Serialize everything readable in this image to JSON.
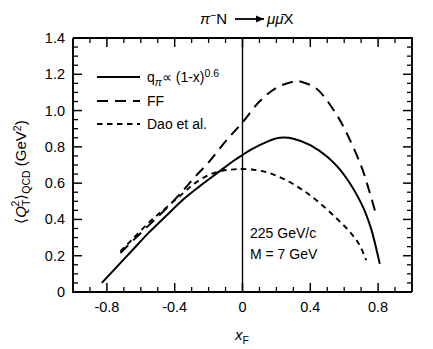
{
  "figure": {
    "top_title": {
      "beam": "π",
      "beam_charge": "−",
      "target": "N",
      "arrow": "⟶",
      "products_mu": "μ",
      "products_mubar": "μ̄",
      "products_x": "X",
      "full": "π−N ⟶ μμ̄X"
    },
    "y_axis_title": {
      "bracket_open": "⟨",
      "q": "Q",
      "sub_t": "T",
      "sup_2": "2",
      "bracket_close": "⟩",
      "sub_qcd": "QCD",
      "units": "(GeV",
      "units_sup": "2",
      "units_close": ")",
      "full": "⟨Q²ₜ⟩QCD (GeV²)"
    },
    "x_axis_title": {
      "main": "x",
      "sub": "F",
      "full": "xF"
    },
    "annotation": {
      "line1": "225 GeV/c",
      "line2": "M = 7 GeV"
    },
    "legend": [
      {
        "style": "solid",
        "label_parts": {
          "q": "q",
          "sub": "π",
          "prop": "∝",
          "expr": "(1-x)",
          "exp": "0.6"
        },
        "label": "qπ ∝ (1-x)0.6"
      },
      {
        "style": "long-dash",
        "label": "FF"
      },
      {
        "style": "short-dash",
        "label": "Dao et al."
      }
    ]
  },
  "chart_data": {
    "type": "line",
    "xlabel": "x_F",
    "ylabel": "⟨Q_T^2⟩_QCD  (GeV^2)",
    "xlim": [
      -1.0,
      1.0
    ],
    "ylim": [
      0,
      1.4
    ],
    "xticks": [
      -0.8,
      -0.4,
      0,
      0.4,
      0.8
    ],
    "xtick_labels": [
      "-0.8",
      "-0.4",
      "0",
      "0.4",
      "0.8"
    ],
    "yticks": [
      0,
      0.2,
      0.4,
      0.6,
      0.8,
      1.0,
      1.2,
      1.4
    ],
    "ytick_labels": [
      "0",
      "0.2",
      "0.4",
      "0.6",
      "0.8",
      "1.0",
      "1.2",
      "1.4"
    ],
    "xminor_step": 0.1,
    "yminor_step": 0.05,
    "grid": false,
    "legend_position": "upper-left-inside",
    "annotations": [
      {
        "text": "225 GeV/c",
        "x": 0.02,
        "y": 0.33
      },
      {
        "text": "M = 7 GeV",
        "x": 0.02,
        "y": 0.255
      }
    ],
    "reference_lines": [
      {
        "orientation": "vertical",
        "x": 0.0,
        "style": "solid"
      }
    ],
    "series": [
      {
        "name": "q_pi ∝ (1-x)^0.6",
        "style": "solid",
        "x": [
          -0.83,
          -0.75,
          -0.65,
          -0.55,
          -0.45,
          -0.35,
          -0.25,
          -0.15,
          -0.05,
          0.0,
          0.05,
          0.15,
          0.22,
          0.3,
          0.4,
          0.5,
          0.6,
          0.7,
          0.76,
          0.81
        ],
        "y": [
          0.05,
          0.13,
          0.23,
          0.33,
          0.42,
          0.51,
          0.585,
          0.655,
          0.725,
          0.755,
          0.785,
          0.83,
          0.85,
          0.845,
          0.81,
          0.745,
          0.645,
          0.49,
          0.345,
          0.155
        ]
      },
      {
        "name": "FF",
        "style": "long-dash",
        "x": [
          -0.72,
          -0.65,
          -0.55,
          -0.45,
          -0.35,
          -0.28,
          -0.2,
          -0.1,
          0.0,
          0.1,
          0.2,
          0.3,
          0.36,
          0.45,
          0.55,
          0.62,
          0.7,
          0.75,
          0.79
        ],
        "y": [
          0.215,
          0.28,
          0.37,
          0.46,
          0.56,
          0.635,
          0.715,
          0.83,
          0.935,
          1.05,
          1.125,
          1.16,
          1.155,
          1.11,
          0.985,
          0.865,
          0.695,
          0.55,
          0.42
        ]
      },
      {
        "name": "Dao et al.",
        "style": "short-dash",
        "x": [
          -0.72,
          -0.65,
          -0.55,
          -0.45,
          -0.35,
          -0.28,
          -0.2,
          -0.12,
          -0.05,
          0.0,
          0.08,
          0.16,
          0.25,
          0.35,
          0.45,
          0.55,
          0.63,
          0.69,
          0.73
        ],
        "y": [
          0.225,
          0.29,
          0.385,
          0.465,
          0.545,
          0.6,
          0.645,
          0.668,
          0.676,
          0.678,
          0.672,
          0.655,
          0.62,
          0.565,
          0.495,
          0.41,
          0.335,
          0.26,
          0.175
        ]
      }
    ]
  }
}
